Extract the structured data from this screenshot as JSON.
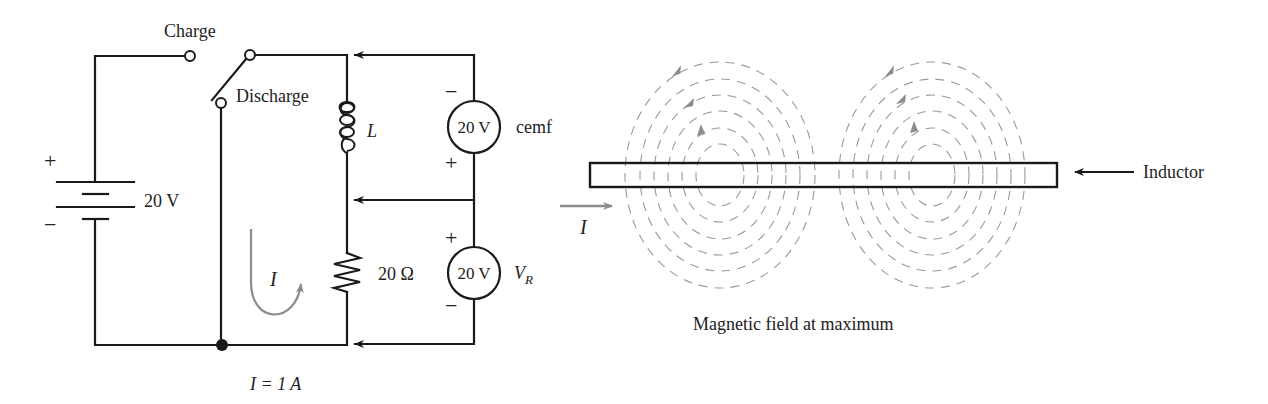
{
  "circuit": {
    "switch": {
      "charge_label": "Charge",
      "discharge_label": "Discharge"
    },
    "battery": {
      "plus_sign": "+",
      "minus_sign": "−",
      "voltage_label": "20 V"
    },
    "inductor": {
      "symbol_label": "L"
    },
    "resistor": {
      "value_label": "20 Ω"
    },
    "cemf_meter": {
      "reading": "20 V",
      "name_label": "cemf",
      "top_sign": "−",
      "bottom_sign": "+"
    },
    "vr_meter": {
      "reading": "20 V",
      "name_label": "V",
      "name_subscript": "R",
      "top_sign": "+",
      "bottom_sign": "−"
    },
    "current_loop_label": "I",
    "current_value_label": "I = 1 A"
  },
  "field_diagram": {
    "current_label": "I",
    "inductor_label": "Inductor",
    "caption": "Magnetic field at maximum"
  },
  "colors": {
    "wire": "#1a1a1a",
    "field_lines": "#9a9a9a",
    "current_arrow": "#8c8c8c"
  }
}
